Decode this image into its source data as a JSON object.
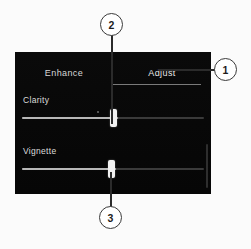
{
  "figure": {
    "background_color": "#fbfbfb",
    "panel_color": "#080808",
    "callout_stroke": "#3a3a3a"
  },
  "panel": {
    "name": "photo-editor-adjust-panel",
    "tabs": [
      {
        "id": "enhance",
        "label": "Enhance",
        "active": false
      },
      {
        "id": "adjust",
        "label": "Adjust",
        "active": true
      }
    ],
    "sliders": [
      {
        "id": "clarity",
        "label": "Clarity",
        "value_percent": 51,
        "handle_left_px": 95
      },
      {
        "id": "vignette",
        "label": "Vignette",
        "value_percent": 51,
        "handle_left_px": 93
      }
    ],
    "scrollbar": {
      "name": "panel-scrollbar"
    }
  },
  "callouts": [
    {
      "id": "callout-1",
      "number": "1",
      "points_to": "Adjust tab"
    },
    {
      "id": "callout-2",
      "number": "2",
      "points_to": "Clarity slider handle"
    },
    {
      "id": "callout-3",
      "number": "3",
      "points_to": "Vignette slider handle"
    }
  ]
}
